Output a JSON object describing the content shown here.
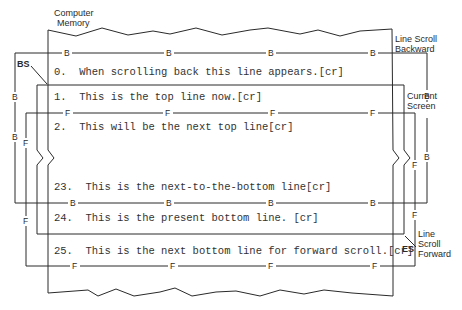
{
  "diagram": {
    "labels": {
      "memory": [
        "Computer",
        "Memory"
      ],
      "backward": [
        "Line Scroll",
        "Backward"
      ],
      "screen": [
        "Current",
        "Screen"
      ],
      "forward": [
        "Line",
        "Scroll",
        "Forward"
      ],
      "bs": "BS",
      "es": "ES"
    },
    "markers": {
      "backward": "B",
      "forward": "F"
    },
    "lines": [
      {
        "id": "line0",
        "text": "0.  When scrolling back this line appears.[cr]"
      },
      {
        "id": "line1",
        "text": "1.  This is the top line now.[cr]"
      },
      {
        "id": "line2",
        "text": "2.  This will be the next top line[cr]"
      },
      {
        "id": "line23",
        "text": "23.  This is the next-to-the-bottom line[cr]"
      },
      {
        "id": "line24",
        "text": "24.  This is the present bottom line. [cr]"
      },
      {
        "id": "line25",
        "text": "25.  This is the next bottom line for forward scroll.[cr]"
      }
    ]
  }
}
